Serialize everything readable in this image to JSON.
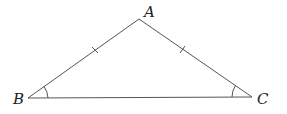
{
  "diagram": {
    "type": "isosceles-triangle",
    "vertices": {
      "A": {
        "label": "A",
        "x": 139,
        "y": 19
      },
      "B": {
        "label": "B",
        "x": 28,
        "y": 98
      },
      "C": {
        "label": "C",
        "x": 252,
        "y": 97
      }
    },
    "equal_sides": [
      "AB",
      "AC"
    ],
    "marked_equal_angles": [
      "B",
      "C"
    ],
    "stroke_color": "#555555",
    "label_color": "#222222"
  }
}
